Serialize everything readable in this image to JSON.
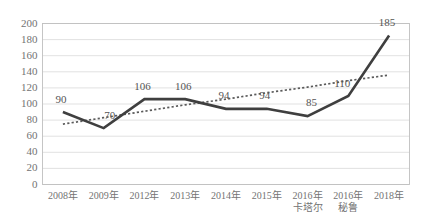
{
  "chart_data": {
    "type": "line",
    "title": "",
    "xlabel": "",
    "ylabel": "",
    "ylim": [
      0,
      200
    ],
    "ytick_step": 20,
    "grid": true,
    "legend": "none",
    "categories": [
      "2008年",
      "2009年",
      "2012年",
      "2013年",
      "2014年",
      "2015年",
      "2016年",
      "2016年",
      "2018年"
    ],
    "categories_line2": [
      "",
      "",
      "",
      "",
      "",
      "",
      "卡塔尔",
      "秘鲁",
      ""
    ],
    "ytick_labels": [
      "200",
      "180",
      "160",
      "140",
      "120",
      "100",
      "80",
      "60",
      "40",
      "20",
      "0"
    ],
    "series": [
      {
        "name": "data",
        "style": "solid",
        "color": "#3f3f3f",
        "values": [
          90,
          70,
          106,
          106,
          94,
          94,
          85,
          110,
          185
        ],
        "labels": [
          "90",
          "70",
          "106",
          "106",
          "94",
          "94",
          "85",
          "110",
          "185"
        ]
      },
      {
        "name": "trendline",
        "style": "dotted",
        "color": "#5a5a5a",
        "values": [
          75,
          83,
          91,
          99,
          106,
          114,
          121,
          129,
          136
        ],
        "labels": []
      }
    ]
  }
}
